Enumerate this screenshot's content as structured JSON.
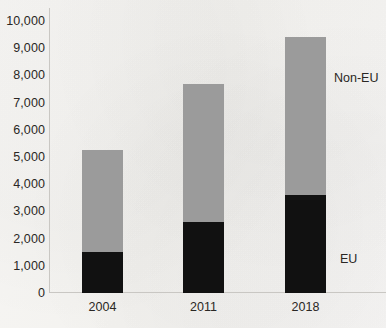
{
  "chart_data": {
    "type": "bar",
    "stacked": true,
    "title": "",
    "subtitle": "",
    "xlabel": "",
    "ylabel": "",
    "categories": [
      "2004",
      "2011",
      "2018"
    ],
    "series": [
      {
        "name": "EU",
        "values": [
          1500,
          2600,
          3600
        ],
        "color": "#111111"
      },
      {
        "name": "Non-EU",
        "values": [
          3740,
          5100,
          5800
        ],
        "color": "#9b9b9b"
      }
    ],
    "totals": [
      5240,
      7700,
      9400
    ],
    "ylim": [
      0,
      10000
    ],
    "ytick_values": [
      0,
      1000,
      2000,
      3000,
      4000,
      5000,
      6000,
      7000,
      8000,
      9000,
      10000
    ],
    "ytick_labels": [
      "0",
      "1,000",
      "2,000",
      "3,000",
      "4,000",
      "5,000",
      "6,000",
      "7,000",
      "8,000",
      "9,000",
      "10,000"
    ],
    "grid": false,
    "legend_position": "inline-annotations",
    "annotations": [
      {
        "text": "Non-EU",
        "series": "Non-EU"
      },
      {
        "text": "EU",
        "series": "EU"
      }
    ]
  },
  "axis": {
    "y": {
      "labels": [
        {
          "value": 10000,
          "text": "10,000"
        },
        {
          "value": 9000,
          "text": "9,000"
        },
        {
          "value": 8000,
          "text": "8,000"
        },
        {
          "value": 7000,
          "text": "7,000"
        },
        {
          "value": 6000,
          "text": "6,000"
        },
        {
          "value": 5000,
          "text": "5,000"
        },
        {
          "value": 4000,
          "text": "4,000"
        },
        {
          "value": 3000,
          "text": "3,000"
        },
        {
          "value": 2000,
          "text": "2,000"
        },
        {
          "value": 1000,
          "text": "1,000"
        },
        {
          "value": 0,
          "text": "0"
        }
      ]
    },
    "x": {
      "labels": [
        {
          "text": "2004"
        },
        {
          "text": "2011"
        },
        {
          "text": "2018"
        }
      ]
    }
  },
  "labels": {
    "non_eu": "Non-EU",
    "eu": "EU"
  },
  "colors": {
    "eu": "#111111",
    "non_eu": "#9b9b9b",
    "axis": "#c9c7c3",
    "text": "#2a2724",
    "background": "#f6f5f3"
  }
}
